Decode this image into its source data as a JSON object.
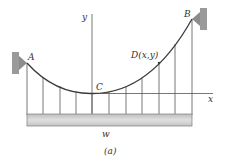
{
  "diagram": {
    "caption": "(a)",
    "points": {
      "A": "A",
      "B": "B",
      "C": "C",
      "D": "D(x,y)"
    },
    "axes": {
      "x": "x",
      "y": "y"
    },
    "load_label": "w",
    "hanger_count": 11,
    "colors": {
      "cable": "#3a3a3a",
      "lines": "#555555",
      "deck_fill": "#cfcfcf",
      "deck_stroke": "#8a8a8a",
      "support_wall": "#9a9a9a",
      "support_triangle": "#8c8c8c"
    }
  }
}
